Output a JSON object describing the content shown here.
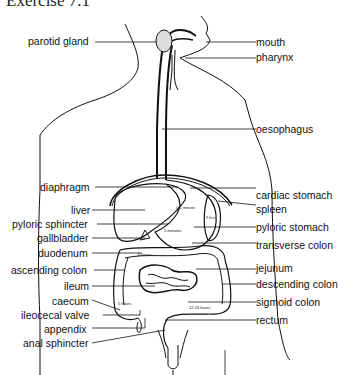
{
  "title": "Exercise 7.1",
  "labels_left": [
    {
      "id": "parotid-gland",
      "text": "parotid gland"
    },
    {
      "id": "diaphragm",
      "text": "diaphragm"
    },
    {
      "id": "liver",
      "text": "liver"
    },
    {
      "id": "pyloric-sphincter",
      "text": "pyloric sphincter"
    },
    {
      "id": "gallbladder",
      "text": "gallbladder"
    },
    {
      "id": "duodenum",
      "text": "duodenum"
    },
    {
      "id": "ascending-colon",
      "text": "ascending colon"
    },
    {
      "id": "ileum",
      "text": "ileum"
    },
    {
      "id": "caecum",
      "text": "caecum"
    },
    {
      "id": "ileocecal-valve",
      "text": "ileocecal valve"
    },
    {
      "id": "appendix",
      "text": "appendix"
    },
    {
      "id": "anal-sphincter",
      "text": "anal sphincter"
    }
  ],
  "labels_right": [
    {
      "id": "mouth",
      "text": "mouth"
    },
    {
      "id": "pharynx",
      "text": "pharynx"
    },
    {
      "id": "oesophagus",
      "text": "oesophagus"
    },
    {
      "id": "cardiac-stomach",
      "text": "cardiac stomach"
    },
    {
      "id": "spleen",
      "text": "spleen"
    },
    {
      "id": "pyloric-stomach",
      "text": "pyloric stomach"
    },
    {
      "id": "transverse-colon",
      "text": "transverse colon"
    },
    {
      "id": "jejunum",
      "text": "jejunum"
    },
    {
      "id": "descending-colon",
      "text": "descending colon"
    },
    {
      "id": "sigmoid-colon",
      "text": "sigmoid colon"
    },
    {
      "id": "rectum",
      "text": "rectum"
    }
  ],
  "time_notes": [
    {
      "id": "cardiac",
      "text": "0-1 minute"
    },
    {
      "id": "pyloric",
      "text": "5 minutes"
    },
    {
      "id": "spleen-side",
      "text": "9 hrs"
    },
    {
      "id": "duodenum",
      "text": "6 hours"
    },
    {
      "id": "caecum",
      "text": "5 hours"
    },
    {
      "id": "sigmoid",
      "text": "12-24 hours"
    }
  ]
}
